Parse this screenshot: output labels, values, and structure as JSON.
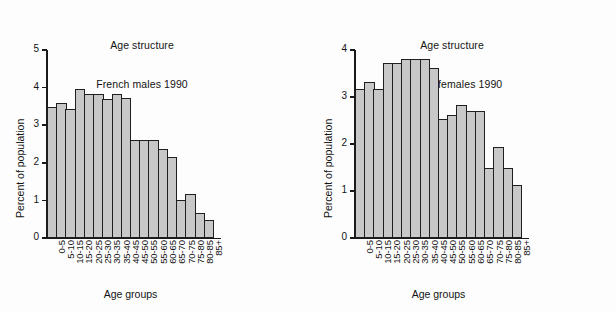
{
  "figure": {
    "background": "#fdfdfd",
    "bar_fill": "#c8c8c8",
    "bar_edge": "#1f1f1f",
    "axis_color": "#1a1a1a"
  },
  "panels": [
    {
      "id": "males",
      "title_line1": "Age structure",
      "title_line2": "French males 1990"
    },
    {
      "id": "females",
      "title_line1": "Age structure",
      "title_line2": "French females 1990"
    }
  ],
  "chart_data": [
    {
      "type": "bar",
      "title": "Age structure\nFrench males 1990",
      "xlabel": "Age groups",
      "ylabel": "Percent of population",
      "ylim": [
        0,
        5
      ],
      "yticks": [
        0,
        1,
        2,
        3,
        4,
        5
      ],
      "ytick_labels": [
        "0",
        "1",
        "2",
        "3",
        "4",
        "5"
      ],
      "grid": false,
      "legend": "none",
      "categories": [
        "0-5",
        "5-10",
        "10-15",
        "15-20",
        "20-25",
        "25-30",
        "30-35",
        "35-40",
        "40-45",
        "45-50",
        "50-55",
        "55-60",
        "60-65",
        "65-70",
        "70-75",
        "75-80",
        "80-85",
        "85+"
      ],
      "values": [
        3.48,
        3.6,
        3.42,
        3.97,
        3.83,
        3.83,
        3.69,
        3.83,
        3.72,
        2.62,
        2.62,
        2.62,
        2.36,
        2.16,
        1.02,
        1.17,
        0.67,
        0.49
      ]
    },
    {
      "type": "bar",
      "title": "Age structure\nFrench females 1990",
      "xlabel": "Age groups",
      "ylabel": "Percent of population",
      "ylim": [
        0,
        4
      ],
      "yticks": [
        0,
        1,
        2,
        3,
        4
      ],
      "ytick_labels": [
        "0",
        "1",
        "2",
        "3",
        "4"
      ],
      "grid": false,
      "legend": "none",
      "categories": [
        "0-5",
        "5-10",
        "10-15",
        "15-20",
        "20-25",
        "25-30",
        "30-35",
        "35-40",
        "40-45",
        "45-50",
        "50-55",
        "55-60",
        "60-65",
        "65-70",
        "70-75",
        "75-80",
        "80-85",
        "85+"
      ],
      "values": [
        3.18,
        3.33,
        3.18,
        3.72,
        3.72,
        3.81,
        3.81,
        3.81,
        3.61,
        2.53,
        2.61,
        2.82,
        2.7,
        2.7,
        1.5,
        1.94,
        1.48,
        1.13
      ]
    }
  ]
}
